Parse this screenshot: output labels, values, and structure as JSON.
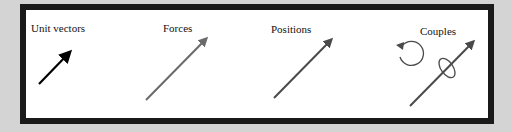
{
  "sections": [
    {
      "label": "Unit vectors",
      "arrow_color": "#000000"
    },
    {
      "label": "Forces",
      "arrow_color": "#6a6a6a"
    },
    {
      "label": "Positions",
      "arrow_color": "#4a4a4a"
    },
    {
      "label": "Couples",
      "arrow_color": "#4a4a4a"
    }
  ],
  "colors": {
    "background": "#d4d4d4",
    "frame_border": "#1a1a1a",
    "panel": "#ffffff"
  }
}
